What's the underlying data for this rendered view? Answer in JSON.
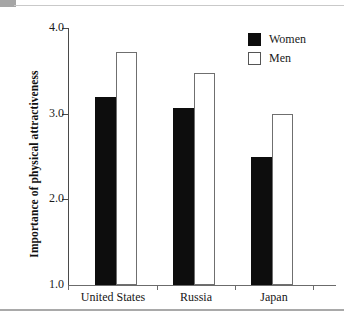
{
  "chart_data": {
    "type": "bar",
    "title": "",
    "xlabel": "",
    "ylabel": "Importance of physical attractiveness",
    "categories": [
      "United States",
      "Russia",
      "Japan"
    ],
    "series": [
      {
        "name": "Women",
        "color": "#0d0d0d",
        "fill": "solid",
        "values": [
          3.2,
          3.07,
          2.5
        ]
      },
      {
        "name": "Men",
        "color": "#ffffff",
        "fill": "hollow",
        "values": [
          3.72,
          3.48,
          3.0
        ]
      }
    ],
    "ylim": [
      1.0,
      4.0
    ],
    "yticks": [
      4.0,
      3.0,
      2.0,
      1.0
    ],
    "ytick_labels": [
      "4.0",
      "3.0",
      "2.0",
      "1.0"
    ],
    "grid": false,
    "legend_position": "top-right"
  },
  "legend": {
    "items": [
      {
        "label": "Women",
        "style": "filled"
      },
      {
        "label": "Men",
        "style": "hollow"
      }
    ]
  },
  "axes": {
    "y_title": "Importance of physical attractiveness",
    "y_tick_labels": [
      "4.0",
      "3.0",
      "2.0",
      "1.0"
    ],
    "x_tick_labels": [
      "United States",
      "Russia",
      "Japan"
    ]
  }
}
